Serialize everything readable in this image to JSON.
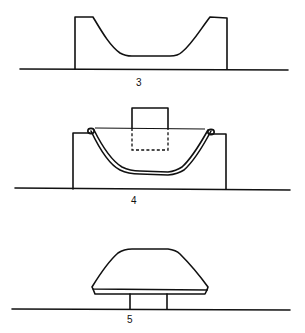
{
  "figure": {
    "panels": [
      {
        "id": "panel-3",
        "label": "3",
        "description": "Mold cavity profile on base line"
      },
      {
        "id": "panel-4",
        "label": "4",
        "description": "Sheet draped into mold cavity with plunger (dashed outline shows plunger travel)"
      },
      {
        "id": "panel-5",
        "label": "5",
        "description": "Formed part removed, shown on stand"
      }
    ],
    "colors": {
      "line": "#111111",
      "background": "#ffffff"
    }
  }
}
